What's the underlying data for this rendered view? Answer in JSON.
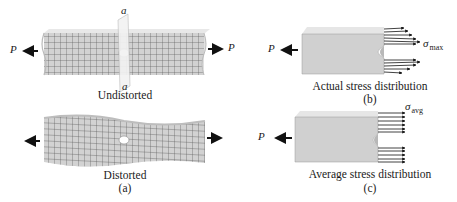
{
  "figure": {
    "panel_a": {
      "load_left": "P",
      "load_right": "P",
      "section_top": "a",
      "section_bottom": "a",
      "caption_top": "Undistorted",
      "caption_bottom": "Distorted",
      "panel_label": "(a)"
    },
    "panel_b": {
      "load": "P",
      "stress_symbol": "σ",
      "stress_subscript": "max",
      "caption": "Actual stress distribution",
      "panel_label": "(b)"
    },
    "panel_c": {
      "load": "P",
      "stress_symbol": "σ",
      "stress_subscript": "avg",
      "caption": "Average stress distribution",
      "panel_label": "(c)"
    },
    "colors": {
      "bar_fill": "#d4d4d4",
      "bar_light": "#e6e6e6",
      "grid": "#5a5a5a",
      "section_plane": "#efefef",
      "arrow": "#111111"
    }
  }
}
